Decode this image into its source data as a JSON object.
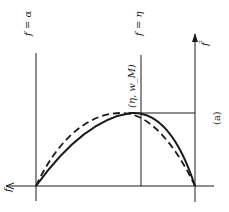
{
  "figure": {
    "caption": "(a)",
    "labels": {
      "line_left": "f = α",
      "line_mid": "f = η",
      "peak_point": "(η, w_M)",
      "axis_horizontal": "f",
      "axis_vertical": "f̂"
    },
    "colors": {
      "ink": "#1a1a1a",
      "background": "#ffffff"
    },
    "curves": [
      {
        "name": "solid-curve",
        "style": "solid"
      },
      {
        "name": "dashed-curve",
        "style": "dashed"
      }
    ],
    "orientation": "rotated 90° clockwise"
  }
}
